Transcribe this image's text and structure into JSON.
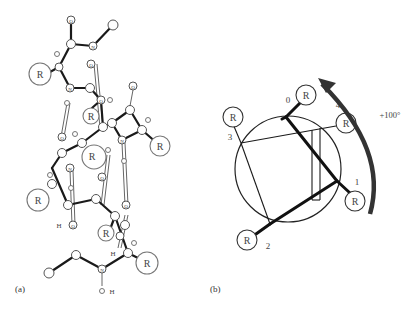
{
  "figure": {
    "panel_a": {
      "caption": "(a)",
      "atom_labels": {
        "oxygen": "O",
        "nitrogen": "N",
        "hydrogen": "H",
        "side_chain": "R"
      },
      "r_groups": [
        "R",
        "R",
        "R",
        "R",
        "R",
        "R",
        "R"
      ]
    },
    "panel_b": {
      "caption": "(b)",
      "rotation_label": "+100°",
      "positions": [
        {
          "index": "0",
          "label": "R"
        },
        {
          "index": "1",
          "label": "R"
        },
        {
          "index": "2",
          "label": "R"
        },
        {
          "index": "3",
          "label": "R"
        },
        {
          "index": "4",
          "label": "R"
        }
      ]
    }
  }
}
